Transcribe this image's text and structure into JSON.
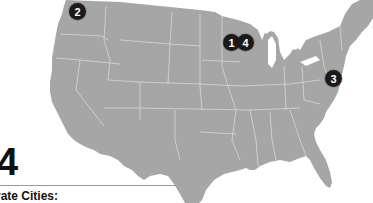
{
  "map": {
    "type": "United States state map",
    "land_color": "#a6a6a6",
    "border_color": "#d8d8d8",
    "water_color": "#ffffff",
    "markers": [
      {
        "label": "1",
        "region": "Minnesota",
        "x": 232,
        "y": 43
      },
      {
        "label": "4",
        "region": "Minnesota / Wisconsin border",
        "x": 246,
        "y": 43
      },
      {
        "label": "2",
        "region": "Washington",
        "x": 78,
        "y": 12
      },
      {
        "label": "3",
        "region": "Mid-Atlantic (DC/Baltimore area)",
        "x": 334,
        "y": 79
      }
    ],
    "marker_color": "#1a1a1a"
  },
  "legend": {
    "big_number": "4",
    "subtitle": "rate Cities:"
  }
}
